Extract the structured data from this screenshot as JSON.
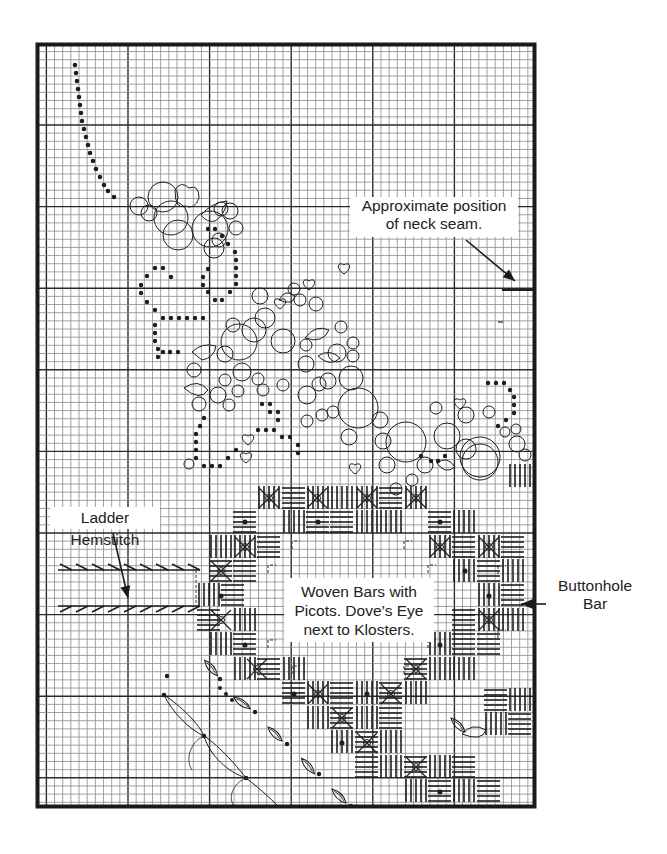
{
  "diagram": {
    "type": "needlework-chart",
    "frame": {
      "left": 36,
      "top": 43,
      "right": 536,
      "bottom": 808,
      "border_color": "#1a1a1a"
    },
    "grid": {
      "cell_size": 8.16,
      "major_every": 10,
      "minor_color": "#8a8a8a",
      "major_color": "#2a2a2a",
      "major_x": [
        128,
        209,
        291,
        372,
        454
      ],
      "major_y": [
        125,
        207,
        290,
        372,
        454,
        536,
        618,
        700,
        782
      ]
    },
    "ink_color": "#1e1e1e"
  },
  "labels": {
    "neck_seam": "Approximate position\nof neck seam.",
    "ladder_hemstitch": "Ladder Hemstitch",
    "woven_bars": "Woven Bars with\nPicots. Dove’s Eye\nnext to Klosters.",
    "buttonhole_bar": "Buttonhole\nBar"
  }
}
